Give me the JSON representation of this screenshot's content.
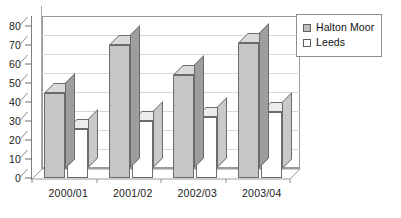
{
  "chart_data": {
    "type": "bar",
    "title": "",
    "subtitle": "",
    "xlabel": "",
    "ylabel": "",
    "categories": [
      "2000/01",
      "2001/02",
      "2002/03",
      "2003/04"
    ],
    "series": [
      {
        "name": "Halton Moor",
        "values": [
          45,
          70,
          54,
          71
        ],
        "color": "#c6c6c6"
      },
      {
        "name": "Leeds",
        "values": [
          26,
          30,
          32,
          35
        ],
        "color": "#ffffff"
      }
    ],
    "ylim": [
      0,
      80
    ],
    "ytick_labels": [
      "0",
      "10",
      "20",
      "30",
      "40",
      "50",
      "60",
      "70",
      "80"
    ],
    "ytick_values": [
      0,
      10,
      20,
      30,
      40,
      50,
      60,
      70,
      80
    ],
    "grid": true,
    "grid_axis": "y",
    "legend_position": "top-right",
    "style": "3d-column-grayscale"
  },
  "legend": {
    "items": [
      {
        "label": "Halton Moor",
        "swatch": "gray"
      },
      {
        "label": "Leeds",
        "swatch": "white"
      }
    ]
  },
  "colors": {
    "bar_gray_face": "#c6c6c6",
    "bar_gray_side": "#9e9e9e",
    "bar_gray_top": "#dadada",
    "bar_white_face": "#ffffff",
    "bar_white_side": "#c9c9c9",
    "bar_white_top": "#ececec",
    "gridline": "#d8d8d8",
    "axis": "#7d7d7d",
    "text": "#1b1b1b"
  }
}
